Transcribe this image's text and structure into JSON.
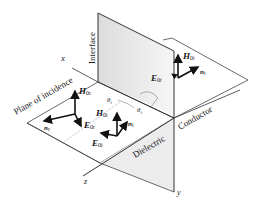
{
  "figure": {
    "type": "oblique-incidence-diagram",
    "colors": {
      "line": "#333333",
      "arrow": "#111111",
      "shade": "#e6e6e6",
      "background": "#ffffff"
    }
  },
  "labels": {
    "interface": "Interface",
    "plane_of_incidence": "Plane of incidence",
    "dielectric": "Dielectric",
    "conductor": "Conductor",
    "axis_x": "x",
    "axis_y": "y",
    "axis_z": "z",
    "theta_i_upper": "θ",
    "theta_i_upper_sub": "i",
    "theta_i_right": "θ",
    "theta_i_right_sub": "i"
  },
  "vectors": {
    "H_reflected": {
      "symbol": "H",
      "sub": "0r"
    },
    "E_reflected": {
      "symbol": "E",
      "sub": "0r"
    },
    "n_reflected": {
      "symbol": "n",
      "sub": "r"
    },
    "H_incident": {
      "symbol": "H",
      "sub": "0i"
    },
    "E_incident": {
      "symbol": "E",
      "sub": "0i"
    },
    "n_incident": {
      "symbol": "n",
      "sub": "i"
    },
    "H_transmitted": {
      "symbol": "H",
      "sub": "0t"
    },
    "E_transmitted": {
      "symbol": "E",
      "sub": "0t"
    },
    "n_transmitted": {
      "symbol": "n",
      "sub": "t"
    }
  }
}
